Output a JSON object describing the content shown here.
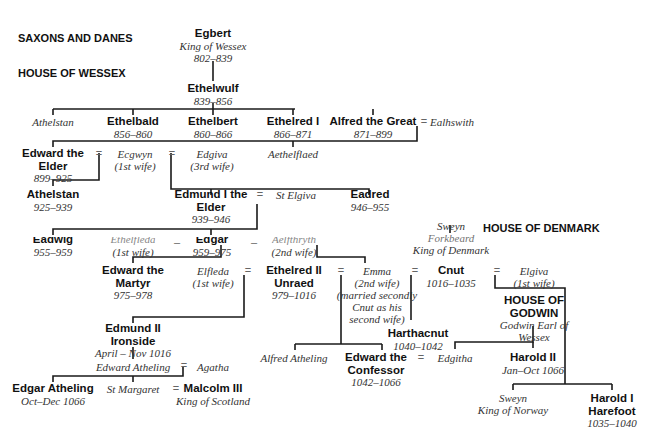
{
  "headings": {
    "saxons_danes": "SAXONS AND DANES",
    "wessex": "HOUSE OF WESSEX",
    "denmark": "HOUSE OF DENMARK",
    "godwin_line1": "HOUSE OF",
    "godwin_line2": "GODWIN"
  },
  "marriage_symbol": "=",
  "persons": {
    "egbert": {
      "name": "Egbert",
      "title": "King of Wessex",
      "reign": "802–839"
    },
    "ethelwulf": {
      "name": "Ethelwulf",
      "reign": "839–856"
    },
    "athelstan_a": {
      "name": "Athelstan"
    },
    "ethelbald": {
      "name": "Ethelbald",
      "reign": "856–860"
    },
    "ethelbert": {
      "name": "Ethelbert",
      "reign": "860–866"
    },
    "ethelred1": {
      "name": "Ethelred I",
      "reign": "866–871"
    },
    "alfred": {
      "name": "Alfred the Great",
      "reign": "871–899"
    },
    "ealhswith": {
      "name": "Ealhswith"
    },
    "edward_elder": {
      "line1": "Edward the",
      "line2": "Elder",
      "reign": "899–925"
    },
    "ecgwyn": {
      "name": "Ecgwyn",
      "note": "(1st wife)"
    },
    "edgiva": {
      "name": "Edgiva",
      "note": "(3rd wife)"
    },
    "aethelflaed": {
      "name": "Aethelflaed"
    },
    "athelstan": {
      "name": "Athelstan",
      "reign": "925–939"
    },
    "edmund1": {
      "line1": "Edmund I the",
      "line2": "Elder",
      "reign": "939–946"
    },
    "st_elgiva": {
      "name": "St Elgiva"
    },
    "eadred": {
      "name": "Eadred",
      "reign": "946–955"
    },
    "eadwig": {
      "name": "Eadwig",
      "reign": "955–959"
    },
    "ethelfleda": {
      "name": "Ethelfleda",
      "note": "(1st wife)"
    },
    "edgar": {
      "name": "Edgar",
      "reign": "959–975"
    },
    "aelfthryth": {
      "name": "Aelfthryth",
      "note": "(2nd wife)"
    },
    "edward_martyr": {
      "line1": "Edward the",
      "line2": "Martyr",
      "reign": "975–978"
    },
    "elfleda": {
      "name": "Elfleda",
      "note": "(1st wife)"
    },
    "ethelred2": {
      "line1": "Ethelred II",
      "line2": "Unraed",
      "reign": "979–1016"
    },
    "emma": {
      "name": "Emma",
      "note1": "(2nd wife)",
      "note2": "(married secondly",
      "note3": "Cnut as his",
      "note4": "second wife)"
    },
    "sweyn_forkbeard": {
      "line1": "Sweyn",
      "line2": "Forkbeard",
      "line3": "King of Denmark"
    },
    "cnut": {
      "name": "Cnut",
      "reign": "1016–1035"
    },
    "elgiva": {
      "name": "Elgiva",
      "note": "(1st wife)"
    },
    "godwin": {
      "line1": "Godwin Earl of",
      "line2": "Wessex"
    },
    "edmund2": {
      "line1": "Edmund II",
      "line2": "Ironside",
      "reign": "April – Nov 1016"
    },
    "harthacnut": {
      "name": "Harthacnut",
      "reign": "1040–1042"
    },
    "edward_atheling": {
      "name": "Edward Atheling"
    },
    "agatha": {
      "name": "Agatha"
    },
    "alfred_atheling": {
      "name": "Alfred Atheling"
    },
    "edward_confessor": {
      "line1": "Edward the",
      "line2": "Confessor",
      "reign": "1042–1066"
    },
    "edgitha": {
      "name": "Edgitha"
    },
    "harold2": {
      "name": "Harold II",
      "reign": "Jan–Oct 1066"
    },
    "edgar_atheling": {
      "name": "Edgar Atheling",
      "reign": "Oct–Dec 1066"
    },
    "st_margaret": {
      "name": "St Margaret"
    },
    "malcolm3": {
      "name": "Malcolm III",
      "title": "King of Scotland"
    },
    "sweyn_norway": {
      "line1": "Sweyn",
      "line2": "King of Norway"
    },
    "harold1": {
      "line1": "Harold I",
      "line2": "Harefoot",
      "reign": "1035–1040"
    }
  }
}
